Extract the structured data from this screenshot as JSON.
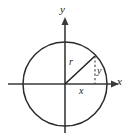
{
  "figure": {
    "background_color": "#ffffff",
    "stroke_color": "#2b2b2b"
  },
  "labels": {
    "y_axis": "y",
    "x_axis": "x",
    "radius": "r",
    "vertical_component": "y",
    "horizontal_component": "x"
  },
  "icons": {
    "y_axis_arrow": "arrow-up-icon",
    "x_axis_arrow": "arrow-right-icon"
  },
  "geometry": {
    "center_x": 65,
    "center_y": 84,
    "radius": 42,
    "point_x": 95,
    "point_y": 56
  }
}
